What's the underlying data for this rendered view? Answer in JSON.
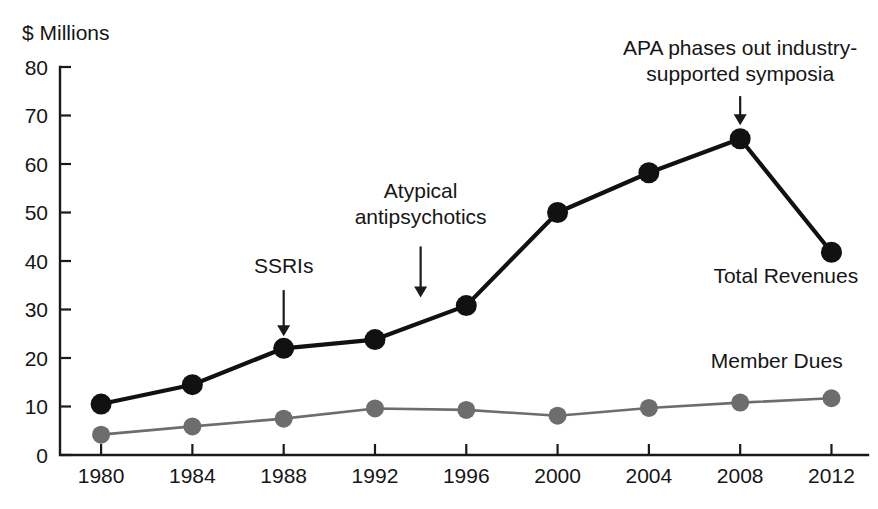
{
  "chart_data": {
    "type": "line",
    "title": "",
    "subtitle": "",
    "xlabel": "",
    "ylabel": "$ Millions",
    "x": [
      1980,
      1984,
      1988,
      1992,
      1996,
      2000,
      2004,
      2008,
      2012
    ],
    "categories": [
      "1980",
      "1984",
      "1988",
      "1992",
      "1996",
      "2000",
      "2004",
      "2008",
      "2012"
    ],
    "series": [
      {
        "name": "Total Revenues",
        "color": "#111111",
        "values": [
          10.5,
          14.5,
          22.0,
          23.8,
          30.8,
          50.0,
          58.2,
          65.2,
          41.8
        ]
      },
      {
        "name": "Member Dues",
        "color": "#6d6d6d",
        "values": [
          4.2,
          5.9,
          7.5,
          9.6,
          9.3,
          8.1,
          9.7,
          10.8,
          11.7
        ]
      }
    ],
    "xlim": [
      1978.2,
      2013.6
    ],
    "ylim": [
      0,
      80
    ],
    "yticks": [
      0,
      10,
      20,
      30,
      40,
      50,
      60,
      70,
      80
    ],
    "ytick_labels": [
      "0",
      "10",
      "20",
      "30",
      "40",
      "50",
      "60",
      "70",
      "80"
    ],
    "xticks": [
      1980,
      1984,
      1988,
      1992,
      1996,
      2000,
      2004,
      2008,
      2012
    ],
    "grid": false,
    "legend_position": "inline-right",
    "annotations": [
      {
        "id": "ssri",
        "lines": [
          "SSRIs"
        ],
        "text_x": 1988.0,
        "text_y": 37.5,
        "arrow_from_x": 1988.0,
        "arrow_from_y": 34.0,
        "arrow_to_x": 1988.0,
        "arrow_to_y": 24.5
      },
      {
        "id": "atypical",
        "lines": [
          "Atypical",
          "antipsychotics"
        ],
        "text_x": 1994.0,
        "text_y": 53.0,
        "arrow_from_x": 1994.0,
        "arrow_from_y": 43.0,
        "arrow_to_x": 1994.0,
        "arrow_to_y": 32.5
      },
      {
        "id": "apa",
        "lines": [
          "APA phases out industry-",
          "supported symposia"
        ],
        "text_x": 2008.0,
        "text_y": 82.5,
        "arrow_from_x": 2008.0,
        "arrow_from_y": 74.0,
        "arrow_to_x": 2008.0,
        "arrow_to_y": 68.0
      }
    ],
    "series_labels": [
      {
        "id": "total",
        "text": "Total Revenues",
        "x": 2010.0,
        "y": 35.5
      },
      {
        "id": "dues",
        "text": "Member Dues",
        "x": 2009.6,
        "y": 18.0
      }
    ]
  },
  "axis": {
    "y_axis_title": "$ Millions",
    "y_tick_labels": [
      "80",
      "70",
      "60",
      "50",
      "40",
      "30",
      "20",
      "10",
      "0"
    ],
    "x_tick_labels": [
      "1980",
      "1984",
      "1988",
      "1992",
      "1996",
      "2000",
      "2004",
      "2008",
      "2012"
    ]
  },
  "annotations_text": {
    "ssri": "SSRIs",
    "atypical_line1": "Atypical",
    "atypical_line2": "antipsychotics",
    "apa_line1": "APA phases out industry-",
    "apa_line2": "supported symposia"
  },
  "series_text": {
    "total_revenues": "Total Revenues",
    "member_dues": "Member Dues"
  },
  "colors": {
    "total_revenues": "#111111",
    "member_dues": "#6d6d6d",
    "axis": "#1a1a1a",
    "text": "#161616",
    "background": "#ffffff"
  }
}
